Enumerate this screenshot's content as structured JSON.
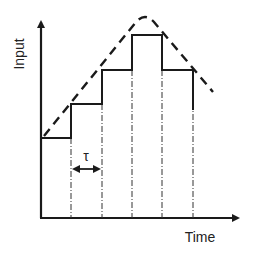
{
  "diagram": {
    "type": "step-approximation",
    "y_axis_label": "Input",
    "x_axis_label": "Time",
    "interval_label": "τ",
    "colors": {
      "stroke": "#1a1a1a",
      "text": "#222222",
      "background": "#ffffff"
    },
    "step_levels_px": [
      138,
      104,
      70,
      35,
      70
    ],
    "step_boundaries_px": [
      41,
      71,
      102,
      132,
      162,
      193
    ],
    "envelope": {
      "style": "dashed",
      "shape": "rise-then-fall",
      "peak_px": [
        145,
        17
      ]
    }
  }
}
